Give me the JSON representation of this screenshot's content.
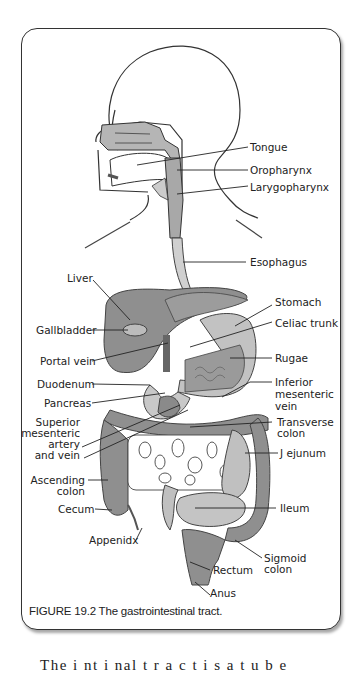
{
  "figure": {
    "caption": "FIGURE 19.2 The gastrointestinal tract.",
    "labels": {
      "tongue": "Tongue",
      "oropharynx": "Oropharynx",
      "larygopharynx": "Larygopharynx",
      "esophagus": "Esophagus",
      "liver": "Liver",
      "stomach": "Stomach",
      "gallbladder": "Gallbladder",
      "celiac_trunk": "Celiac trunk",
      "portal_vein": "Portal vein",
      "rugae": "Rugae",
      "duodenum": "Duodenum",
      "inferior_mesenteric_vein": [
        "Inferior",
        "mesenteric",
        "vein"
      ],
      "pancreas": "Pancreas",
      "superior_mesenteric": [
        "Superior",
        "mesenteric",
        "artery",
        "and vein"
      ],
      "transverse_colon": [
        "Transverse",
        "colon"
      ],
      "jejunum": "J ejunum",
      "ascending_colon": [
        "Ascending",
        "colon"
      ],
      "cecum": "Cecum",
      "ileum": "Ileum",
      "appendix": "Appenidx",
      "sigmoid_colon": [
        "Sigmoid",
        "colon"
      ],
      "rectum": "Rectum",
      "anus": "Anus"
    },
    "colors": {
      "organ_dark": "#8a8a8a",
      "organ_light": "#bdbdbd",
      "vessel": "#555555",
      "outline": "#333333"
    }
  },
  "body_text_fragment": "The  i  nt  i  nal    t  r  a  c  t     i  s    a    t  u  b  e"
}
